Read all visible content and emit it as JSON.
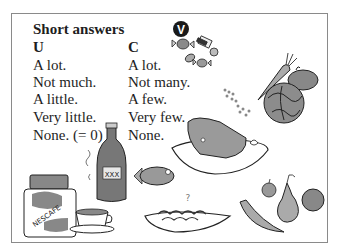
{
  "heading": "Short answers",
  "badge": "V",
  "columns": [
    {
      "header": "U",
      "items": [
        "A lot.",
        "Not much.",
        "A little.",
        "Very little.",
        "None. (= 0)"
      ]
    },
    {
      "header": "C",
      "items": [
        "A lot.",
        "Not many.",
        "A few.",
        "Very few.",
        "None."
      ]
    }
  ],
  "illustrations": {
    "jar_label": "NESCAFE",
    "bottle_label": "XXX",
    "items": [
      "coffee-jar",
      "coffee-cup",
      "bottle",
      "fish",
      "ham-on-plate",
      "spaghetti-plate",
      "candies",
      "carrot",
      "peas",
      "cabbage",
      "potato",
      "banana",
      "apple",
      "pear",
      "orange"
    ]
  }
}
